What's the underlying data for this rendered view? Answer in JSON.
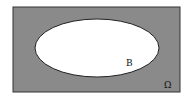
{
  "diagram": {
    "type": "venn",
    "universe": {
      "label": "Ω",
      "fill": "#8a8a8a",
      "stroke": "#333333"
    },
    "sets": [
      {
        "label": "B",
        "fill": "#ffffff",
        "stroke": "#222222"
      }
    ]
  }
}
